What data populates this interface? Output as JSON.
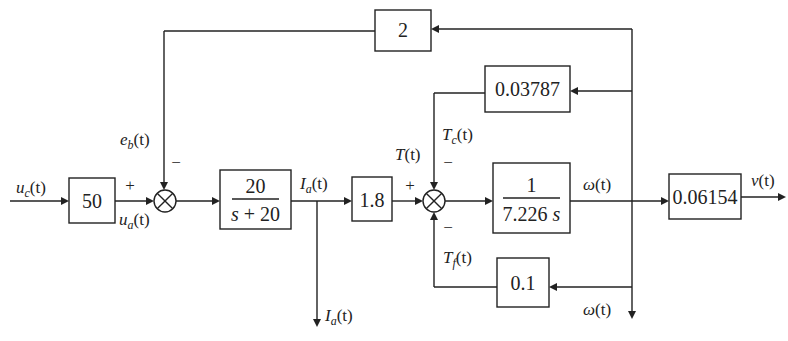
{
  "diagram": {
    "type": "block-diagram",
    "blocks": {
      "input_gain": "50",
      "armature": {
        "numerator": "20",
        "denominator": "s + 20"
      },
      "torque_const": "1.8",
      "inertia": {
        "numerator": "1",
        "denominator": "7.226 s"
      },
      "output_gain": "0.06154",
      "back_emf": "2",
      "coulomb": "0.03787",
      "friction": "0.1"
    },
    "signals": {
      "uc": {
        "base": "u",
        "sub": "c",
        "arg": "(t)"
      },
      "ua": {
        "base": "u",
        "sub": "a",
        "arg": "(t)"
      },
      "eb": {
        "base": "e",
        "sub": "b",
        "arg": "(t)"
      },
      "ia_top": {
        "base": "I",
        "sub": "a",
        "arg": "(t)"
      },
      "ia_out": {
        "base": "I",
        "sub": "a",
        "arg": "(t)"
      },
      "T": {
        "base": "T",
        "arg": "(t)"
      },
      "Tc": {
        "base": "T",
        "sub": "c",
        "arg": "(t)"
      },
      "Tf": {
        "base": "T",
        "sub": "f",
        "arg": "(t)"
      },
      "omega_top": {
        "base": "ω",
        "arg": "(t)"
      },
      "omega_out": {
        "base": "ω",
        "arg": "(t)"
      },
      "v": {
        "base": "v",
        "arg": "(t)"
      }
    },
    "signs": {
      "sum1_plus": "+",
      "sum1_minus": "−",
      "sum2_plus": "+",
      "sum2_minus_top": "−",
      "sum2_minus_bottom": "−"
    }
  }
}
